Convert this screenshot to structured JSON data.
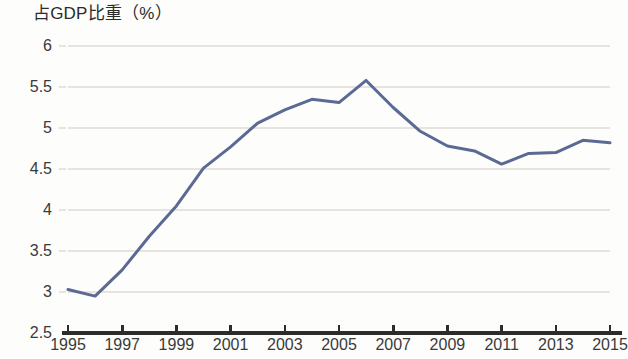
{
  "chart_data": {
    "type": "line",
    "title": "占GDP比重（%）",
    "subtitle": "",
    "xlabel": "",
    "ylabel": "",
    "x": [
      1995,
      1996,
      1997,
      1998,
      1999,
      2000,
      2001,
      2002,
      2003,
      2004,
      2005,
      2006,
      2007,
      2008,
      2009,
      2010,
      2011,
      2012,
      2013,
      2014,
      2015
    ],
    "values": [
      3.03,
      2.95,
      3.27,
      3.68,
      4.05,
      4.51,
      4.77,
      5.06,
      5.22,
      5.35,
      5.31,
      5.58,
      5.25,
      4.96,
      4.78,
      4.72,
      4.56,
      4.69,
      4.7,
      4.85,
      4.82
    ],
    "series": [
      {
        "name": "占GDP比重（%）",
        "values": [
          3.03,
          2.95,
          3.27,
          3.68,
          4.05,
          4.51,
          4.77,
          5.06,
          5.22,
          5.35,
          5.31,
          5.58,
          5.25,
          4.96,
          4.78,
          4.72,
          4.56,
          4.69,
          4.7,
          4.85,
          4.82
        ]
      }
    ],
    "xlim": [
      1995,
      2015
    ],
    "ylim": [
      2.5,
      6
    ],
    "y_ticks": [
      "6",
      "5.5",
      "5",
      "4.5",
      "4",
      "3.5",
      "3",
      "2.5"
    ],
    "y_tick_values": [
      6,
      5.5,
      5,
      4.5,
      4,
      3.5,
      3,
      2.5
    ],
    "x_ticks": [
      "1995",
      "1997",
      "1999",
      "2001",
      "2003",
      "2005",
      "2007",
      "2009",
      "2011",
      "2013",
      "2015"
    ],
    "x_tick_values": [
      1995,
      1997,
      1999,
      2001,
      2003,
      2005,
      2007,
      2009,
      2011,
      2013,
      2015
    ],
    "grid": true,
    "legend": false,
    "legend_position": "none",
    "colors": {
      "line": "#5b6a94",
      "grid": "#e6e4dc",
      "axis": "#2c2c2c",
      "text": "#3a3a3a",
      "background": "#fdfdfb"
    },
    "line_width": 3,
    "markers": false
  }
}
